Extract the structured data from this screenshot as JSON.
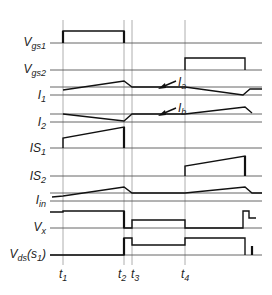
{
  "diagram": {
    "type": "timing-waveform",
    "x_start": 50,
    "x_end": 262,
    "time_markers": [
      {
        "id": "t1",
        "label": "t",
        "sub": "1",
        "x": 63
      },
      {
        "id": "t2",
        "label": "t",
        "sub": "2",
        "x": 124
      },
      {
        "id": "t3",
        "label": "t",
        "sub": "3",
        "x": 132
      },
      {
        "id": "t4",
        "label": "t",
        "sub": "4",
        "x": 185
      }
    ],
    "signals": [
      {
        "id": "vgs1",
        "label": "V",
        "sub": "gs1",
        "baseline_y": 43
      },
      {
        "id": "vgs2",
        "label": "V",
        "sub": "gs2",
        "baseline_y": 70
      },
      {
        "id": "i1",
        "label": "I",
        "sub": "1",
        "baseline_y": 95,
        "ref_y": 87
      },
      {
        "id": "i2",
        "label": "I",
        "sub": "2",
        "baseline_y": 122,
        "ref_y": 114
      },
      {
        "id": "is1",
        "label": "IS",
        "sub": "1",
        "baseline_y": 148
      },
      {
        "id": "is2",
        "label": "IS",
        "sub": "2",
        "baseline_y": 176
      },
      {
        "id": "iin",
        "label": "I",
        "sub": "in",
        "baseline_y": 201,
        "ref_y": 193
      },
      {
        "id": "vx",
        "label": "V",
        "sub": "x",
        "baseline_y": 228
      },
      {
        "id": "vds",
        "label": "V",
        "sub": "ds",
        "suffix_open": "(s",
        "suffix_sub": "1",
        "suffix_close": ")",
        "baseline_y": 255
      }
    ],
    "annotations": [
      {
        "id": "ia",
        "label": "I",
        "sub": "a",
        "text_x": 179,
        "text_y": 84,
        "arrow_from": [
          176,
          81
        ],
        "arrow_to": [
          160,
          88
        ]
      },
      {
        "id": "ib",
        "label": "I",
        "sub": "b",
        "text_x": 179,
        "text_y": 111,
        "arrow_from": [
          176,
          107
        ],
        "arrow_to": [
          160,
          114
        ]
      }
    ],
    "colors": {
      "waveform": "#111111",
      "gridline": "#9a9a9a",
      "baseline": "#555555",
      "text": "#222222"
    }
  }
}
